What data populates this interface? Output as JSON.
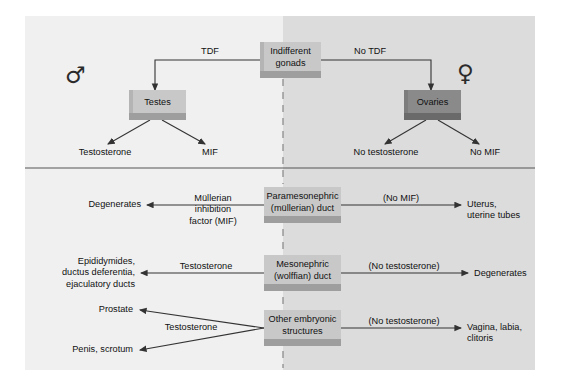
{
  "figure": {
    "colors": {
      "panel_male_bg": "#f0f0f0",
      "panel_female_bg": "#dcdcdc",
      "box_light": "#c8c8c8",
      "box_dark": "#8a8a8a",
      "line": "#333333",
      "divider": "#555555"
    }
  },
  "symbols": {
    "male": "♂",
    "female": "♀"
  },
  "top": {
    "source_box": "Indifferent\ngonads",
    "source_line1": "Indifferent",
    "source_line2": "gonads",
    "left_arrow_label": "TDF",
    "right_arrow_label": "No TDF",
    "male_box": "Testes",
    "female_box": "Ovaries",
    "male_outputs": [
      "Testosterone",
      "MIF"
    ],
    "female_outputs": [
      "No testosterone",
      "No MIF"
    ]
  },
  "rows": [
    {
      "center_line1": "Paramesonephric",
      "center_line2": "(müllerian) duct",
      "left_arrow_label_lines": [
        "Müllerian",
        "inhibition",
        "factor (MIF)"
      ],
      "left_result_lines": [
        "Degenerates"
      ],
      "right_arrow_label": "(No MIF)",
      "right_result_lines": [
        "Uterus,",
        "uterine tubes"
      ]
    },
    {
      "center_line1": "Mesonephric",
      "center_line2": "(wolffian) duct",
      "left_arrow_label_lines": [
        "Testosterone"
      ],
      "left_result_lines": [
        "Epididymides,",
        "ductus deferentia,",
        "ejaculatory ducts"
      ],
      "right_arrow_label": "(No testosterone)",
      "right_result_lines": [
        "Degenerates"
      ]
    },
    {
      "center_line1": "Other embryonic",
      "center_line2": "structures",
      "left_arrow_label_lines": [
        "Testosterone"
      ],
      "left_result_upper": "Prostate",
      "left_result_lower": "Penis, scrotum",
      "right_arrow_label": "(No testosterone)",
      "right_result_lines": [
        "Vagina, labia,",
        "clitoris"
      ]
    }
  ]
}
